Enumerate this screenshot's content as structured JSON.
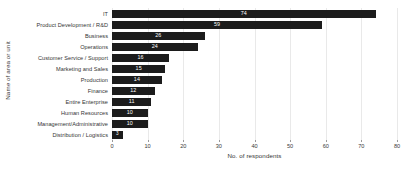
{
  "chart_data": {
    "type": "bar",
    "orientation": "horizontal",
    "title": "",
    "xlabel": "No. of respondents",
    "ylabel": "Name of area or unit",
    "xlim": [
      0,
      80
    ],
    "xticks": [
      0,
      10,
      20,
      30,
      40,
      50,
      60,
      70,
      80
    ],
    "grid": true,
    "legend": null,
    "bar_color": "#1c1c1c",
    "value_label_color": "#ffffff",
    "categories": [
      "IT",
      "Product Development / R&D",
      "Business",
      "Operations",
      "Customer Service / Support",
      "Marketing and Sales",
      "Production",
      "Finance",
      "Entire Enterprise",
      "Human Resources",
      "Management/Administrative",
      "Distribution / Logistics"
    ],
    "values": [
      74,
      59,
      26,
      24,
      16,
      15,
      14,
      12,
      11,
      10,
      10,
      3
    ]
  }
}
